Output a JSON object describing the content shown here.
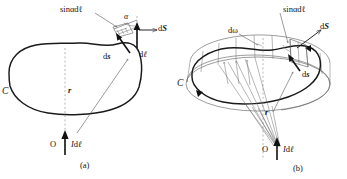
{
  "figure": {
    "panels": [
      {
        "id": "a",
        "caption": "(a)",
        "labels": {
          "curve": "C",
          "sin_alpha_dl": "sinαdℓ",
          "alpha": "α",
          "dS": "d",
          "dS_vec": "S",
          "ds": "d",
          "ds_vec": "s",
          "dl": "d",
          "dl_vec": "ℓ",
          "r": "r",
          "origin": "O",
          "current_I": "I",
          "current_dl_d": "d",
          "current_dl_vec": "ℓ"
        }
      },
      {
        "id": "b",
        "caption": "(b)",
        "labels": {
          "curve": "C",
          "sin_alpha_dl": "sinαdℓ",
          "domega": "dω",
          "dS": "d",
          "dS_vec": "S",
          "ds": "d",
          "ds_vec": "s",
          "r": "r",
          "origin": "O",
          "current_I": "I",
          "current_dl_d": "d",
          "current_dl_vec": "ℓ"
        }
      }
    ],
    "colors": {
      "ink": "#1a1a1a",
      "thin_line": "#5a5a5a",
      "dashed_axis": "#9a9a9a",
      "background": "#ffffff"
    }
  }
}
